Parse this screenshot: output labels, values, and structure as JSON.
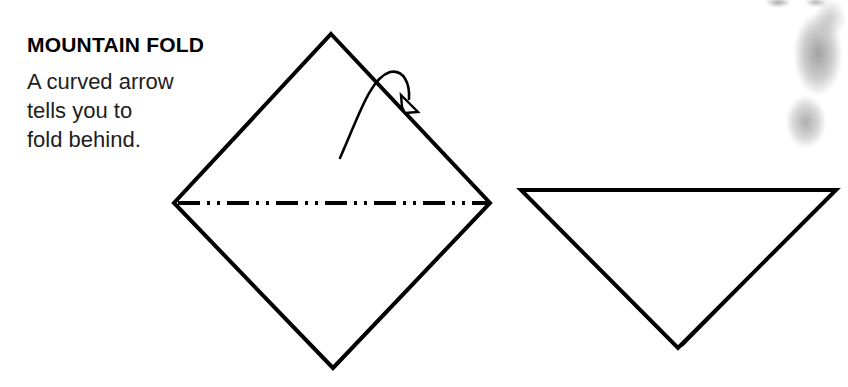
{
  "page": {
    "width": 848,
    "height": 387,
    "background_color": "#ffffff",
    "ink_color": "#000000"
  },
  "caption": {
    "title": "MOUNTAIN FOLD",
    "body_lines": [
      "A curved arrow",
      "tells you to",
      "fold behind."
    ]
  },
  "diagram": {
    "step_before": {
      "name": "square-diamond-with-mountain-crease",
      "shape": "diamond",
      "vertices": {
        "top": [
          331,
          34
        ],
        "right": [
          490,
          203
        ],
        "bottom": [
          333,
          368
        ],
        "left": [
          174,
          203
        ]
      },
      "stroke_width": 4,
      "crease": {
        "type": "mountain-fold-line",
        "style": "dash-dot-dot",
        "from": [
          178,
          203
        ],
        "to": [
          487,
          203
        ],
        "stroke_width": 4,
        "dash_pattern": "22 7 3 7 3 7"
      }
    },
    "arrow": {
      "name": "curved-fold-behind-arrow",
      "meaning": "fold behind",
      "tail": [
        340,
        158
      ],
      "apex": [
        392,
        72
      ],
      "head_tip": [
        414,
        110
      ],
      "head_style": "hollow-triangle",
      "stroke_width": 2
    },
    "step_after": {
      "name": "resulting-triangle",
      "shape": "triangle",
      "vertices": {
        "top_left": [
          521,
          190
        ],
        "top_right": [
          836,
          190
        ],
        "bottom": [
          678,
          348
        ]
      },
      "stroke_width": 4,
      "hidden_layer_edge": {
        "description": "doubled line along lower-right edge showing layer folded behind",
        "from": [
          681,
          347
        ],
        "to": [
          833,
          193
        ],
        "stroke_width": 2
      }
    }
  },
  "artifacts": [
    {
      "name": "scan-bleed-leg",
      "region": [
        786,
        0,
        62,
        150
      ],
      "color": "#8c8c8c"
    },
    {
      "name": "scan-bleed-top-edge",
      "region": [
        760,
        0,
        76,
        14
      ],
      "color": "#6e6e6e"
    }
  ]
}
